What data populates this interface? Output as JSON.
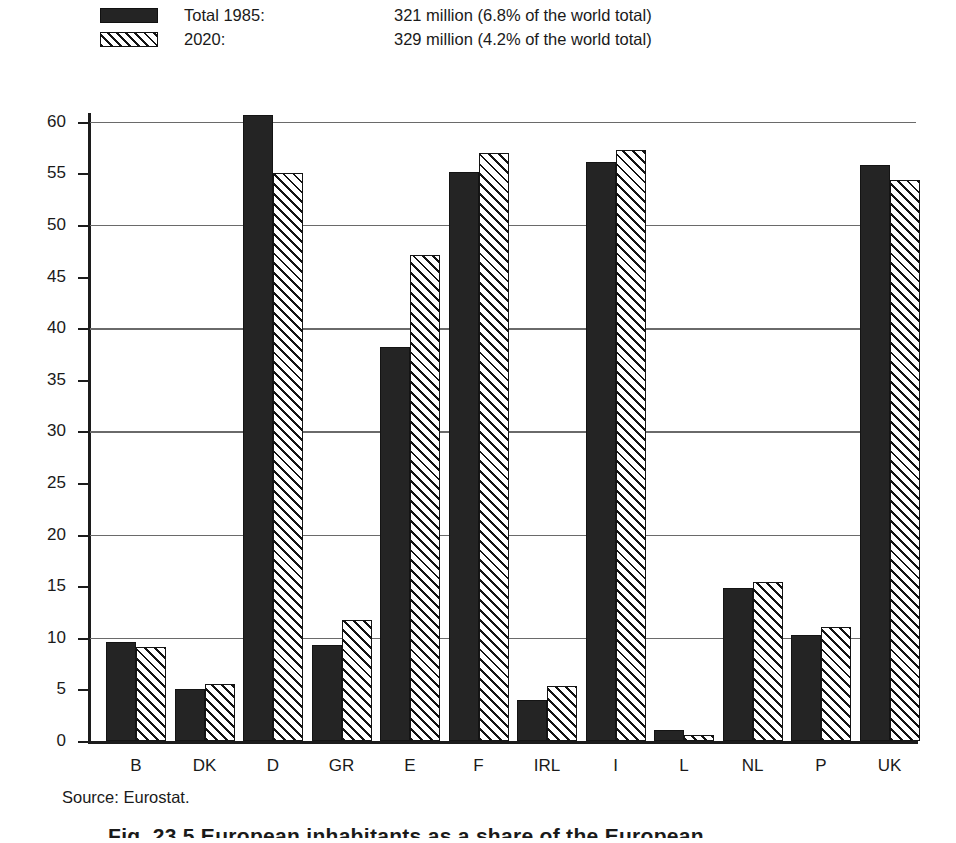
{
  "legend": {
    "series": [
      {
        "key": "1985",
        "swatch": "solid-black-swatch",
        "label": "Total 1985:",
        "value": "321 million (6.8% of the world total)"
      },
      {
        "key": "2020",
        "swatch": "diagonal-hatch-swatch",
        "label": "2020:",
        "value": "329 million (4.2% of the world total)"
      }
    ]
  },
  "source": "Source: Eurostat.",
  "caption": "Fig. 23.5  European inhabitants as a share of the European",
  "axis": {
    "y_ticks": [
      "0",
      "5",
      "10",
      "15",
      "20",
      "25",
      "30",
      "35",
      "40",
      "45",
      "50",
      "55",
      "60"
    ],
    "gridline_values": [
      10,
      20,
      30,
      40,
      50,
      60
    ]
  },
  "chart_data": {
    "type": "bar",
    "title": "",
    "subtitle": "",
    "xlabel": "",
    "ylabel": "",
    "ylim": [
      0,
      62
    ],
    "grid": "horizontal-at-multiples-of-10",
    "legend_position": "above-plot",
    "categories": [
      "B",
      "DK",
      "D",
      "GR",
      "E",
      "F",
      "IRL",
      "I",
      "L",
      "NL",
      "P",
      "UK"
    ],
    "series": [
      {
        "name": "Total 1985",
        "values": [
          9.6,
          5.0,
          60.7,
          9.3,
          38.2,
          55.1,
          4.0,
          56.1,
          1.1,
          14.8,
          10.3,
          55.8
        ]
      },
      {
        "name": "2020",
        "values": [
          9.1,
          5.5,
          55.0,
          11.7,
          47.1,
          57.0,
          5.3,
          57.3,
          0.6,
          15.4,
          11.0,
          54.4
        ]
      }
    ]
  }
}
